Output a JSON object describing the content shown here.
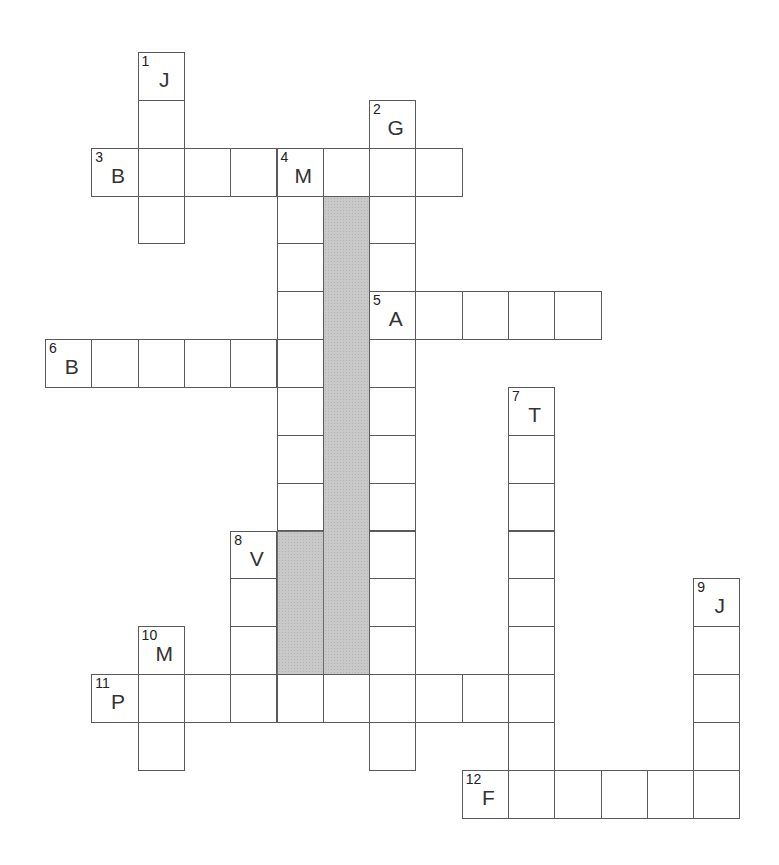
{
  "puzzle": {
    "grid": {
      "origin_x": 45,
      "origin_y": 52,
      "cell_width": 46.3,
      "cell_height": 47.85
    },
    "colors": {
      "cell_border": "#5a5a5a",
      "cell_fill": "#ffffff",
      "shaded_fill": "#c9c9c9"
    },
    "words": [
      {
        "number": "1",
        "direction": "down",
        "row": 0,
        "col": 2,
        "length": 4,
        "first_letter": "J"
      },
      {
        "number": "2",
        "direction": "down",
        "row": 1,
        "col": 7,
        "length": 14,
        "first_letter": "G"
      },
      {
        "number": "3",
        "direction": "across",
        "row": 2,
        "col": 1,
        "length": 8,
        "first_letter": "B"
      },
      {
        "number": "4",
        "direction": "down",
        "row": 2,
        "col": 5,
        "length": 8,
        "first_letter": "M"
      },
      {
        "number": "5",
        "direction": "across",
        "row": 5,
        "col": 7,
        "length": 5,
        "first_letter": "A"
      },
      {
        "number": "6",
        "direction": "across",
        "row": 6,
        "col": 0,
        "length": 6,
        "first_letter": "B"
      },
      {
        "number": "7",
        "direction": "down",
        "row": 7,
        "col": 10,
        "length": 9,
        "first_letter": "T"
      },
      {
        "number": "8",
        "direction": "down",
        "row": 10,
        "col": 4,
        "length": 4,
        "first_letter": "V"
      },
      {
        "number": "9",
        "direction": "down",
        "row": 11,
        "col": 14,
        "length": 5,
        "first_letter": "J"
      },
      {
        "number": "10",
        "direction": "down",
        "row": 12,
        "col": 2,
        "length": 3,
        "first_letter": "M"
      },
      {
        "number": "11",
        "direction": "across",
        "row": 13,
        "col": 1,
        "length": 10,
        "first_letter": "P"
      },
      {
        "number": "12",
        "direction": "across",
        "row": 15,
        "col": 9,
        "length": 6,
        "first_letter": "F"
      }
    ],
    "shaded_regions": [
      {
        "col": 6,
        "row_start": 3,
        "row_end": 12
      },
      {
        "col": 5,
        "row_start": 10,
        "row_end": 12
      }
    ]
  }
}
